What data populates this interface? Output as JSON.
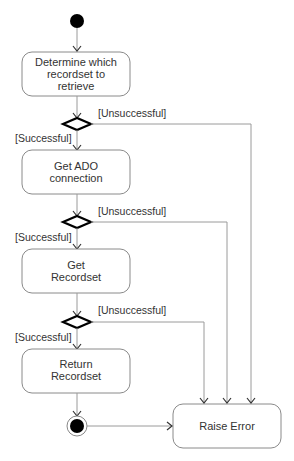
{
  "diagram": {
    "type": "UML activity diagram",
    "activities": [
      {
        "id": "a1",
        "lines": [
          "Determine which",
          "recordset to",
          "retrieve"
        ]
      },
      {
        "id": "a2",
        "lines": [
          "Get ADO",
          "connection"
        ]
      },
      {
        "id": "a3",
        "lines": [
          "Get",
          "Recordset"
        ]
      },
      {
        "id": "a4",
        "lines": [
          "Return",
          "Recordset"
        ]
      },
      {
        "id": "err",
        "lines": [
          "Raise Error"
        ]
      }
    ],
    "guards": {
      "success": "[Successful]",
      "failure": "[Unsuccessful]"
    },
    "decisions": [
      {
        "id": "d1",
        "success_label": "[Successful]",
        "failure_label": "[Unsuccessful]"
      },
      {
        "id": "d2",
        "success_label": "[Successful]",
        "failure_label": "[Unsuccessful]"
      },
      {
        "id": "d3",
        "success_label": "[Successful]",
        "failure_label": "[Unsuccessful]"
      }
    ],
    "colors": {
      "node_fill": "#000000",
      "box_stroke": "#8a8a8a",
      "edge": "#9a9a9a"
    }
  }
}
